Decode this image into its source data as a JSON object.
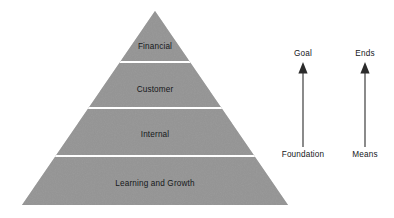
{
  "figure": {
    "type": "pyramid-diagram",
    "background_color": "#ffffff",
    "pyramid": {
      "fill_color": "#8e8e8e",
      "divider_color": "#ffffff",
      "apex": {
        "x": 155,
        "y": 11
      },
      "base_left": {
        "x": 22,
        "y": 205
      },
      "base_right": {
        "x": 288,
        "y": 205
      },
      "tiers": [
        {
          "label": "Financial",
          "center_x": 155,
          "center_y": 47,
          "top_y": 11,
          "bottom_y": 62
        },
        {
          "label": "Customer",
          "center_x": 155,
          "center_y": 90,
          "top_y": 62,
          "bottom_y": 108
        },
        {
          "label": "Internal",
          "center_x": 155,
          "center_y": 135,
          "top_y": 108,
          "bottom_y": 156
        },
        {
          "label": "Learning and Growth",
          "center_x": 155,
          "center_y": 184,
          "top_y": 156,
          "bottom_y": 205
        }
      ]
    },
    "arrows": [
      {
        "name": "goal-arrow",
        "top_label": "Goal",
        "bottom_label": "Foundation",
        "x": 303,
        "head_y": 63,
        "tail_y": 147,
        "top_label_y": 54,
        "bottom_label_y": 155,
        "color": "#2b2b2b",
        "direction": "up"
      },
      {
        "name": "ends-arrow",
        "top_label": "Ends",
        "bottom_label": "Means",
        "x": 365,
        "head_y": 63,
        "tail_y": 147,
        "top_label_y": 54,
        "bottom_label_y": 155,
        "color": "#2b2b2b",
        "direction": "up"
      }
    ]
  }
}
